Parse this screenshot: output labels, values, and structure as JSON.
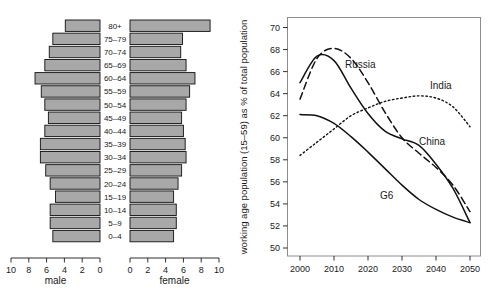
{
  "figure": {
    "panels": [
      "population-pyramid",
      "working-age-share-line-chart"
    ]
  },
  "pyramid": {
    "left_axis_title": "male",
    "right_axis_title": "female",
    "x_ticks": [
      "10",
      "8",
      "6",
      "4",
      "2",
      "0"
    ],
    "x_ticks_right": [
      "0",
      "2",
      "4",
      "6",
      "8",
      "10"
    ],
    "age_groups": [
      "80+",
      "75–79",
      "70–74",
      "65–69",
      "60–64",
      "55–59",
      "50–54",
      "45–49",
      "40–44",
      "35–39",
      "30–34",
      "25–29",
      "20–24",
      "15–19",
      "10–14",
      "5–9",
      "0–4"
    ],
    "male_values": [
      3.9,
      5.3,
      5.7,
      6.2,
      7.3,
      6.6,
      6.2,
      5.8,
      6.2,
      6.7,
      6.7,
      6.1,
      5.6,
      5.0,
      5.6,
      5.6,
      5.3
    ],
    "female_values": [
      9.0,
      5.9,
      5.7,
      6.3,
      7.3,
      6.7,
      6.3,
      5.8,
      6.0,
      6.2,
      6.3,
      5.8,
      5.4,
      4.9,
      5.2,
      5.2,
      4.9
    ],
    "bar_color": "#a8a8a8",
    "bar_edge_color": "#101010"
  },
  "linechart": {
    "ylabel": "working age population (15–59) as % of total population",
    "x_ticks": [
      2000,
      2010,
      2020,
      2030,
      2040,
      2050
    ],
    "y_ticks": [
      50,
      52,
      54,
      56,
      58,
      60,
      62,
      64,
      66,
      68,
      70
    ],
    "xlim": [
      2000,
      2050
    ],
    "ylim": [
      49.2,
      70.6
    ],
    "labels": {
      "russia": "Russia",
      "india": "India",
      "china": "China",
      "g6": "G6"
    }
  },
  "chart_data": [
    {
      "type": "bar",
      "title": "Population pyramid",
      "orientation": "horizontal-pyramid",
      "categories": [
        "80+",
        "75–79",
        "70–74",
        "65–69",
        "60–64",
        "55–59",
        "50–54",
        "45–49",
        "40–44",
        "35–39",
        "30–34",
        "25–29",
        "20–24",
        "15–19",
        "10–14",
        "5–9",
        "0–4"
      ],
      "series": [
        {
          "name": "male",
          "values": [
            3.9,
            5.3,
            5.7,
            6.2,
            7.3,
            6.6,
            6.2,
            5.8,
            6.2,
            6.7,
            6.7,
            6.1,
            5.6,
            5.0,
            5.6,
            5.6,
            5.3
          ]
        },
        {
          "name": "female",
          "values": [
            9.0,
            5.9,
            5.7,
            6.3,
            7.3,
            6.7,
            6.3,
            5.8,
            6.0,
            6.2,
            6.3,
            5.8,
            5.4,
            4.9,
            5.2,
            5.2,
            4.9
          ]
        }
      ],
      "xlabel": "",
      "ylabel": "",
      "xlim": [
        0,
        10
      ],
      "grid": false,
      "legend": "none"
    },
    {
      "type": "line",
      "title": "",
      "xlabel": "",
      "ylabel": "working age population (15–59) as % of total population",
      "x": [
        2000,
        2005,
        2010,
        2015,
        2020,
        2025,
        2030,
        2035,
        2040,
        2045,
        2050
      ],
      "xlim": [
        2000,
        2050
      ],
      "ylim": [
        49.2,
        70.6
      ],
      "grid": false,
      "legend": "inline-annotations",
      "series": [
        {
          "name": "Russia",
          "style": "dashed",
          "values": [
            63.5,
            67.2,
            68.1,
            67.2,
            65.0,
            62.3,
            60.0,
            58.6,
            57.3,
            55.7,
            53.3
          ]
        },
        {
          "name": "India",
          "style": "dotted",
          "values": [
            58.4,
            59.6,
            60.8,
            62.0,
            62.7,
            63.3,
            63.6,
            63.8,
            63.6,
            62.8,
            61.0
          ]
        },
        {
          "name": "China",
          "style": "solid",
          "values": [
            65.0,
            67.4,
            67.0,
            64.5,
            62.2,
            60.6,
            59.9,
            59.3,
            57.6,
            55.4,
            52.3
          ]
        },
        {
          "name": "G6",
          "style": "solid",
          "values": [
            62.1,
            62.0,
            61.3,
            60.1,
            58.7,
            57.2,
            55.7,
            54.4,
            53.5,
            52.8,
            52.3
          ]
        }
      ]
    }
  ]
}
